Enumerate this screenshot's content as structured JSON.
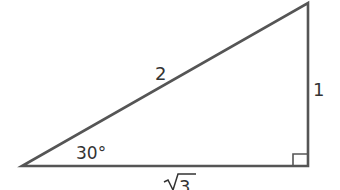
{
  "diagram": {
    "type": "right-triangle",
    "colors": {
      "stroke": "#555555",
      "text": "#333333",
      "background": "#ffffff"
    },
    "vertices": {
      "left": {
        "x": 22,
        "y": 166
      },
      "right_angle": {
        "x": 308,
        "y": 166
      },
      "top": {
        "x": 308,
        "y": 3
      }
    },
    "labels": {
      "hypotenuse": "2",
      "vertical_leg": "1",
      "horizontal_leg": "3",
      "sqrt_symbol": "√",
      "angle": "30°"
    },
    "right_angle_marker": true
  }
}
